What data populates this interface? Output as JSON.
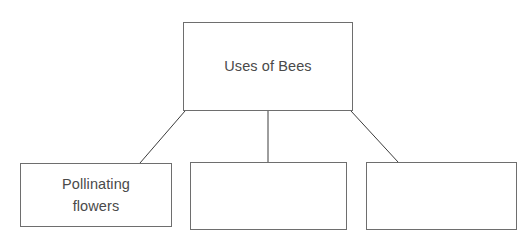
{
  "diagram": {
    "type": "hierarchy-tree",
    "title": "Uses of Bees",
    "background_color": "#ffffff",
    "border_color": "#6e6e6e",
    "text_color": "#4a4a4a",
    "root": {
      "label": "Uses of Bees"
    },
    "children": [
      {
        "label": "Pollinating\nflowers",
        "filled": true
      },
      {
        "label": "",
        "filled": false
      },
      {
        "label": "",
        "filled": false
      }
    ],
    "connectors": [
      {
        "name": "root-to-child-1",
        "x1": 185,
        "y1": 111,
        "x2": 140,
        "y2": 163
      },
      {
        "name": "root-to-child-2",
        "x1": 268,
        "y1": 111,
        "x2": 268,
        "y2": 162
      },
      {
        "name": "root-to-child-3",
        "x1": 351,
        "y1": 111,
        "x2": 398,
        "y2": 162
      }
    ]
  }
}
